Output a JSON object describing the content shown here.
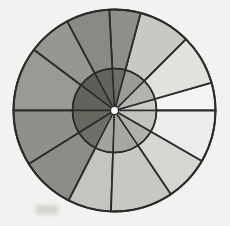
{
  "figure": {
    "title": "",
    "background_color": "#f2f2f0",
    "edge_color": "#2b2b2b",
    "hub_color": "#fbfbfa",
    "center": {
      "x": 114.5,
      "y": 110.5
    },
    "outer_radius": 101,
    "inner_radius": 42,
    "hub_radius": 4
  },
  "chart_data": {
    "type": "pie",
    "title": "",
    "subtitle": "",
    "xlabel": "",
    "ylabel": "",
    "grid": false,
    "legend": "none",
    "units": "degrees",
    "angle_origin": "east",
    "angle_direction": "counterclockwise",
    "radius_max": 101,
    "radius_inner": 42,
    "categories": [
      "wedge-1",
      "wedge-2",
      "wedge-3",
      "wedge-4",
      "wedge-5",
      "wedge-6",
      "wedge-7",
      "wedge-8",
      "wedge-9",
      "wedge-10",
      "wedge-11",
      "wedge-12"
    ],
    "slices": [
      {
        "label": "wedge-1",
        "start_angle": 0,
        "end_angle": 16,
        "sweep": 16,
        "radius": 101,
        "color": "#f4f3f1"
      },
      {
        "label": "wedge-2",
        "start_angle": 16,
        "end_angle": 45,
        "sweep": 29,
        "radius": 101,
        "color": "#e2e1dd"
      },
      {
        "label": "wedge-3",
        "start_angle": 45,
        "end_angle": 75,
        "sweep": 30,
        "radius": 101,
        "color": "#c9c8c3"
      },
      {
        "label": "wedge-4",
        "start_angle": 75,
        "end_angle": 93,
        "sweep": 18,
        "radius": 101,
        "color": "#8f8e89"
      },
      {
        "label": "wedge-5",
        "start_angle": 93,
        "end_angle": 118,
        "sweep": 25,
        "radius": 101,
        "color": "#8a8984"
      },
      {
        "label": "wedge-6",
        "start_angle": 118,
        "end_angle": 143,
        "sweep": 25,
        "radius": 101,
        "color": "#979691"
      },
      {
        "label": "wedge-7",
        "start_angle": 143,
        "end_angle": 180,
        "sweep": 37,
        "radius": 101,
        "color": "#9a9994"
      },
      {
        "label": "wedge-8",
        "start_angle": 180,
        "end_angle": 212,
        "sweep": 32,
        "radius": 101,
        "color": "#90908b"
      },
      {
        "label": "wedge-9",
        "start_angle": 212,
        "end_angle": 243,
        "sweep": 31,
        "radius": 101,
        "color": "#8d8c87"
      },
      {
        "label": "wedge-10",
        "start_angle": 243,
        "end_angle": 268,
        "sweep": 25,
        "radius": 101,
        "color": "#c5c4bf"
      },
      {
        "label": "wedge-11",
        "start_angle": 268,
        "end_angle": 304,
        "sweep": 36,
        "radius": 101,
        "color": "#c8c7c2"
      },
      {
        "label": "wedge-12",
        "start_angle": 304,
        "end_angle": 330,
        "sweep": 26,
        "radius": 101,
        "color": "#d6d5d1"
      },
      {
        "label": "wedge-13",
        "start_angle": 330,
        "end_angle": 360,
        "sweep": 30,
        "radius": 101,
        "color": "#edecea"
      }
    ],
    "inner_slices": [
      {
        "label": "inner-1",
        "start_angle": 0,
        "end_angle": 16,
        "radius": 42,
        "color": "#cbcac5"
      },
      {
        "label": "inner-2",
        "start_angle": 16,
        "end_angle": 45,
        "radius": 42,
        "color": "#b4b3ae"
      },
      {
        "label": "inner-3",
        "start_angle": 45,
        "end_angle": 75,
        "radius": 42,
        "color": "#9b9a95"
      },
      {
        "label": "inner-4",
        "start_angle": 75,
        "end_angle": 93,
        "radius": 42,
        "color": "#6d6c68"
      },
      {
        "label": "inner-5",
        "start_angle": 93,
        "end_angle": 118,
        "radius": 42,
        "color": "#63625e"
      },
      {
        "label": "inner-6",
        "start_angle": 118,
        "end_angle": 143,
        "radius": 42,
        "color": "#5d5c58"
      },
      {
        "label": "inner-7",
        "start_angle": 143,
        "end_angle": 180,
        "radius": 42,
        "color": "#63625e"
      },
      {
        "label": "inner-8",
        "start_angle": 180,
        "end_angle": 212,
        "radius": 42,
        "color": "#68675f"
      },
      {
        "label": "inner-9",
        "start_angle": 212,
        "end_angle": 243,
        "radius": 42,
        "color": "#6e6d69"
      },
      {
        "label": "inner-10",
        "start_angle": 243,
        "end_angle": 268,
        "radius": 42,
        "color": "#a3a29d"
      },
      {
        "label": "inner-11",
        "start_angle": 268,
        "end_angle": 304,
        "radius": 42,
        "color": "#a7a6a1"
      },
      {
        "label": "inner-12",
        "start_angle": 304,
        "end_angle": 330,
        "radius": 42,
        "color": "#b0afaa"
      },
      {
        "label": "inner-13",
        "start_angle": 330,
        "end_angle": 360,
        "radius": 42,
        "color": "#c3c2bd"
      }
    ],
    "annotations": []
  }
}
